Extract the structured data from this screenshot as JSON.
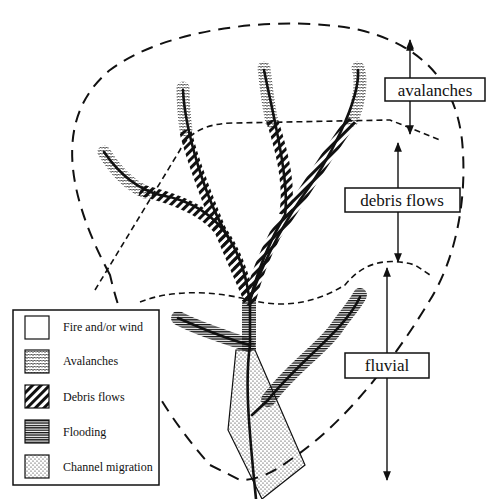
{
  "diagram": {
    "type": "watershed disturbance zones",
    "colors": {
      "ink": "#111111",
      "background": "#ffffff"
    }
  },
  "zones": [
    {
      "id": "avalanches",
      "label": "avalanches"
    },
    {
      "id": "debris_flows",
      "label": "debris flows"
    },
    {
      "id": "fluvial",
      "label": "fluvial"
    }
  ],
  "legend": {
    "items": [
      {
        "pattern": "blank",
        "label": "Fire and/or wind"
      },
      {
        "pattern": "zigzag",
        "label": "Avalanches"
      },
      {
        "pattern": "diagonal-stripes",
        "label": "Debris flows"
      },
      {
        "pattern": "horizontal-lines",
        "label": "Flooding"
      },
      {
        "pattern": "dots",
        "label": "Channel migration"
      }
    ]
  }
}
